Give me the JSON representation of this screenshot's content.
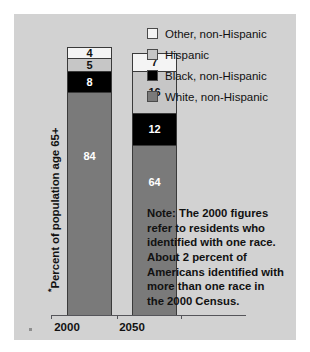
{
  "chart_data": {
    "type": "bar",
    "subtype": "stacked-column",
    "title": "",
    "xlabel": "",
    "ylabel": "Percent of population age 65+",
    "ylabel_marker": "*",
    "ylim": [
      0,
      100
    ],
    "grid": false,
    "legend_position": "top-right",
    "categories": [
      "2000",
      "2050"
    ],
    "series": [
      {
        "name": "White, non-Hispanic",
        "values": [
          84,
          64
        ],
        "color": "#7a7a7a",
        "label_color": "#ffffff"
      },
      {
        "name": "Black, non-Hispanic",
        "values": [
          8,
          12
        ],
        "color": "#000000",
        "label_color": "#ffffff"
      },
      {
        "name": "Hispanic",
        "values": [
          5,
          16
        ],
        "color": "#c6c6c6",
        "label_color": "#111111"
      },
      {
        "name": "Other, non-Hispanic",
        "values": [
          4,
          7
        ],
        "color": "#f4f4f4",
        "label_color": "#111111"
      }
    ],
    "stack_order_bottom_to_top": [
      "White, non-Hispanic",
      "Black, non-Hispanic",
      "Hispanic",
      "Other, non-Hispanic"
    ],
    "annotations": [
      "Note: The 2000 figures refer to residents who identified with one race. About 2 percent of Americans identified with more than one race in the 2000 Census."
    ]
  },
  "axis": {
    "y_label": "Percent of population age 65+",
    "y_label_asterisk": "*",
    "x_ticks": [
      "2000",
      "2050"
    ]
  },
  "legend": {
    "items": [
      {
        "label": "Other, non-Hispanic",
        "swatch": "#f4f4f4"
      },
      {
        "label": "Hispanic",
        "swatch": "#c6c6c6"
      },
      {
        "label": "Black, non-Hispanic",
        "swatch": "#000000"
      },
      {
        "label": "White, non-Hispanic",
        "swatch": "#7a7a7a"
      }
    ]
  },
  "bars": {
    "b2000": {
      "category": "2000",
      "segments": [
        {
          "key": "other",
          "value": "4"
        },
        {
          "key": "hispanic",
          "value": "5"
        },
        {
          "key": "black",
          "value": "8"
        },
        {
          "key": "white",
          "value": "84"
        }
      ]
    },
    "b2050": {
      "category": "2050",
      "segments": [
        {
          "key": "other",
          "value": "7"
        },
        {
          "key": "hispanic",
          "value": "16"
        },
        {
          "key": "black",
          "value": "12"
        },
        {
          "key": "white",
          "value": "64"
        }
      ]
    }
  },
  "note": {
    "lines": [
      "Note: The 2000 figures",
      "refer to residents who",
      "identified with one race.",
      "About 2 percent of",
      "Americans identified with",
      "more than one race in",
      "the 2000 Census."
    ]
  },
  "colors": {
    "panel_bg": "#d2d2d2",
    "page_bg": "#ffffff",
    "white_nh": "#7a7a7a",
    "black_nh": "#000000",
    "hispanic": "#c6c6c6",
    "other_nh": "#f4f4f4",
    "axis_line": "#55555a",
    "text": "#111111"
  }
}
